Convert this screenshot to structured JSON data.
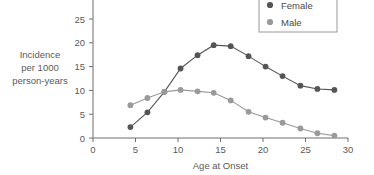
{
  "chart_data": {
    "type": "line",
    "title": "",
    "xlabel": "Age at Onset",
    "ylabel": "Incidence per 1000 person-years",
    "ylabel_lines": [
      "Incidence",
      "per 1000",
      "person-years"
    ],
    "xlim": [
      0,
      30
    ],
    "ylim": [
      0,
      27
    ],
    "xticks": [
      0,
      5,
      10,
      15,
      20,
      25,
      30
    ],
    "xtick_labels": [
      "0",
      "5",
      "10",
      "15",
      "20",
      "25",
      "30"
    ],
    "yticks": [
      0,
      5,
      10,
      15,
      20,
      25
    ],
    "ytick_labels": [
      "0",
      "5",
      "10",
      "15",
      "20",
      "25"
    ],
    "grid": false,
    "legend_position": "top-right",
    "x": [
      4.4,
      6.4,
      8.4,
      10.3,
      12.3,
      14.2,
      16.2,
      18.3,
      20.3,
      22.3,
      24.4,
      26.4,
      28.4
    ],
    "series": [
      {
        "name": "Female",
        "color": "#555555",
        "marker": "circle",
        "values": [
          2.3,
          5.4,
          9.7,
          14.6,
          17.4,
          19.5,
          19.3,
          17.2,
          15.0,
          13.0,
          11.0,
          10.3,
          10.1
        ]
      },
      {
        "name": "Male",
        "color": "#9a9a9a",
        "marker": "circle",
        "values": [
          6.9,
          8.4,
          9.7,
          10.1,
          9.8,
          9.5,
          7.9,
          5.5,
          4.3,
          3.2,
          2.0,
          1.0,
          0.5
        ]
      }
    ]
  },
  "legend": {
    "entries": [
      {
        "label": "Female",
        "color": "#555555"
      },
      {
        "label": "Male",
        "color": "#9a9a9a"
      }
    ]
  },
  "colors": {
    "female": "#555555",
    "male": "#9a9a9a",
    "axis": "#6e6e6e",
    "text": "#5a5a5a",
    "background": "#ffffff"
  }
}
